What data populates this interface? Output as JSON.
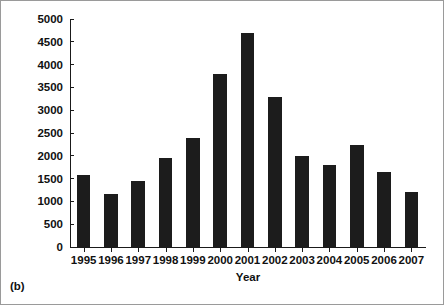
{
  "figure": {
    "panel_caption": "(b)",
    "bar_color": "#1c1c1c",
    "axis_color": "#1a1a1a",
    "background": "#ffffff",
    "border_color": "#9a9a9a"
  },
  "chart_data": {
    "type": "bar",
    "title": "",
    "xlabel": "Year",
    "ylabel": "New Venture Capital Funds Raised ($ million)",
    "categories": [
      "1995",
      "1996",
      "1997",
      "1998",
      "1999",
      "2000",
      "2001",
      "2002",
      "2003",
      "2004",
      "2005",
      "2006",
      "2007"
    ],
    "values": [
      1570,
      1170,
      1450,
      1950,
      2400,
      3800,
      4700,
      3280,
      1990,
      1800,
      2230,
      1650,
      1200
    ],
    "ylim": [
      0,
      5000
    ],
    "yticks": [
      0,
      500,
      1000,
      1500,
      2000,
      2500,
      3000,
      3500,
      4000,
      4500,
      5000
    ],
    "ytick_labels": [
      "0",
      "500",
      "1000",
      "1500",
      "2000",
      "2500",
      "3000",
      "3500",
      "4000",
      "4500",
      "5000"
    ],
    "grid": false,
    "legend": null,
    "legend_position": "none"
  }
}
